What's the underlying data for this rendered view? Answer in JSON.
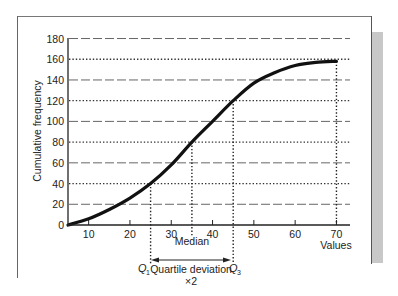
{
  "chart_data": {
    "type": "line",
    "title": "",
    "xlabel": "Values",
    "ylabel": "Cumulative frequency",
    "xlim": [
      5,
      72
    ],
    "ylim": [
      0,
      180
    ],
    "x_ticks": [
      10,
      20,
      30,
      40,
      50,
      60,
      70
    ],
    "y_ticks": [
      0,
      20,
      40,
      60,
      80,
      100,
      120,
      140,
      160,
      180
    ],
    "grid": "horizontal (alternating dashed and dotted)",
    "series": [
      {
        "name": "Cumulative frequency (ogive)",
        "x": [
          5,
          10,
          15,
          20,
          25,
          30,
          35,
          40,
          45,
          50,
          55,
          60,
          65,
          70
        ],
        "values": [
          0,
          6,
          15,
          26,
          40,
          58,
          80,
          100,
          120,
          137,
          147,
          154,
          157,
          158
        ]
      }
    ],
    "annotations": {
      "q1": {
        "label": "Q",
        "sub": "1",
        "x": 25,
        "y": 40
      },
      "median": {
        "label": "Median",
        "x": 35,
        "y": 80
      },
      "q3": {
        "label": "Q",
        "sub": "3",
        "x": 45,
        "y": 120
      },
      "max": {
        "x": 70,
        "y": 158
      },
      "quartile_deviation_label": "Quartile deviation",
      "quartile_deviation_multiplier": "×2"
    }
  }
}
